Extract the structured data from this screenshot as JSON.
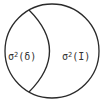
{
  "diagram": {
    "type": "venn-partition",
    "stroke_color": "#2a2a2a",
    "background": "#ffffff",
    "regions": [
      {
        "id": "left",
        "symbol": "σ",
        "exponent": "2",
        "argument": "(δ)"
      },
      {
        "id": "right",
        "symbol": "σ",
        "exponent": "2",
        "argument": "(I)"
      }
    ]
  }
}
